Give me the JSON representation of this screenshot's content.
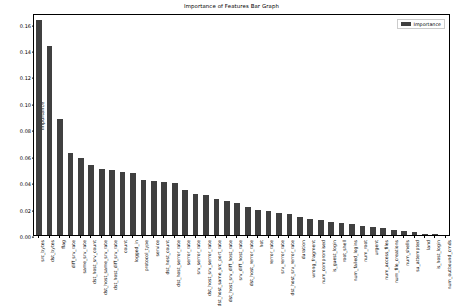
{
  "chart_data": {
    "type": "bar",
    "title": "Importance of Features Bar Graph",
    "xlabel": "",
    "ylabel": "Importance",
    "ylim": [
      0.0,
      0.168
    ],
    "yticks": [
      "0.00",
      "0.02",
      "0.04",
      "0.06",
      "0.08",
      "0.10",
      "0.12",
      "0.14",
      "0.16"
    ],
    "ytick_values": [
      0.0,
      0.02,
      0.04,
      0.06,
      0.08,
      0.1,
      0.12,
      0.14,
      0.16
    ],
    "grid": false,
    "legend_position": "upper right",
    "legend": [
      "Importance"
    ],
    "bar_color": "#404040",
    "categories": [
      "src_bytes",
      "dst_bytes",
      "flag",
      "diff_srv_rate",
      "same_srv_rate",
      "dst_host_srv_count",
      "dst_host_same_srv_rate",
      "dst_host_diff_srv_rate",
      "count",
      "logged_in",
      "protocol_type",
      "service",
      "dst_host_count",
      "dst_host_serror_rate",
      "serror_rate",
      "srv_serror_rate",
      "dst_host_srv_serror_rate",
      "dst_host_same_src_port_rate",
      "dst_host_srv_diff_host_rate",
      "srv_diff_host_rate",
      "dst_host_rerror_rate",
      "hot",
      "rerror_rate",
      "srv_rerror_rate",
      "dst_host_srv_rerror_rate",
      "duration",
      "wrong_fragment",
      "num_compromised",
      "is_guest_login",
      "root_shell",
      "num_failed_logins",
      "num_root",
      "urgent",
      "num_access_files",
      "num_file_creations",
      "num_shells",
      "su_attempted",
      "land",
      "is_host_login",
      "num_outbound_cmds"
    ],
    "values": [
      0.163,
      0.143,
      0.088,
      0.062,
      0.058,
      0.053,
      0.05,
      0.049,
      0.048,
      0.047,
      0.042,
      0.041,
      0.04,
      0.039,
      0.034,
      0.031,
      0.03,
      0.027,
      0.026,
      0.024,
      0.021,
      0.019,
      0.018,
      0.017,
      0.016,
      0.014,
      0.012,
      0.011,
      0.01,
      0.009,
      0.008,
      0.007,
      0.006,
      0.005,
      0.004,
      0.003,
      0.002,
      0.001,
      0.0005,
      0.0
    ],
    "series": [
      {
        "name": "Importance",
        "values": [
          0.163,
          0.143,
          0.088,
          0.062,
          0.058,
          0.053,
          0.05,
          0.049,
          0.048,
          0.047,
          0.042,
          0.041,
          0.04,
          0.039,
          0.034,
          0.031,
          0.03,
          0.027,
          0.026,
          0.024,
          0.021,
          0.019,
          0.018,
          0.017,
          0.016,
          0.014,
          0.012,
          0.011,
          0.01,
          0.009,
          0.008,
          0.007,
          0.006,
          0.005,
          0.004,
          0.003,
          0.002,
          0.001,
          0.0005,
          0.0
        ]
      }
    ]
  }
}
